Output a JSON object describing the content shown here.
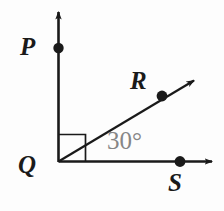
{
  "figure": {
    "background_color": "#fdfdfd",
    "stroke_color": "#1a1a1a",
    "angle_text_color": "#868686"
  },
  "labels": {
    "p": "P",
    "q": "Q",
    "r": "R",
    "s": "S",
    "angle": "30°"
  },
  "geometry": {
    "vertex": "Q",
    "ray_up_endpoint_label": "P",
    "ray_diagonal_endpoint_label": "R",
    "ray_right_endpoint_label": "S",
    "angle_RQS_degrees": "30",
    "angle_PQR_marker": "right-angle"
  }
}
